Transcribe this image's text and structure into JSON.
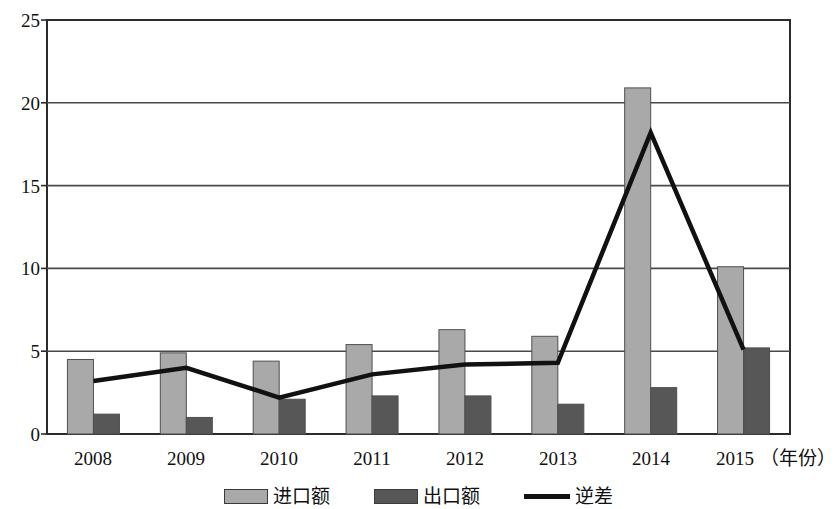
{
  "chart_data": {
    "type": "bar",
    "title": "",
    "subtitle": "",
    "xlabel": "（年份）",
    "ylabel": "",
    "categories": [
      "2008",
      "2009",
      "2010",
      "2011",
      "2012",
      "2013",
      "2014",
      "2015"
    ],
    "ylim": [
      0,
      25
    ],
    "yticks": [
      0,
      5,
      10,
      15,
      20,
      25
    ],
    "grid": true,
    "legend_position": "bottom",
    "series": [
      {
        "name": "进口额",
        "type": "bar",
        "color": "#a9a9a9",
        "values": [
          4.5,
          4.9,
          4.4,
          5.4,
          6.3,
          5.9,
          20.9,
          10.1
        ]
      },
      {
        "name": "出口额",
        "type": "bar",
        "color": "#575757",
        "values": [
          1.2,
          1.0,
          2.1,
          2.3,
          2.3,
          1.8,
          2.8,
          5.2
        ]
      },
      {
        "name": "逆差",
        "type": "line",
        "color": "#111111",
        "values": [
          3.2,
          4.0,
          2.2,
          3.6,
          4.2,
          4.3,
          18.2,
          5.1
        ]
      }
    ]
  },
  "axis": {
    "y_tick_labels": [
      "25",
      "20",
      "15",
      "10",
      "5",
      "0"
    ],
    "x_tick_labels": [
      "2008",
      "2009",
      "2010",
      "2011",
      "2012",
      "2013",
      "2014",
      "2015"
    ],
    "x_axis_unit": "（年份）"
  },
  "legend": {
    "items": [
      {
        "label": "进口额",
        "marker": "bar-swatch-light",
        "color": "#a9a9a9"
      },
      {
        "label": "出口额",
        "marker": "bar-swatch-dark",
        "color": "#575757"
      },
      {
        "label": "逆差",
        "marker": "line-swatch-black",
        "color": "#111111"
      }
    ]
  },
  "plot_geometry": {
    "left": 47,
    "right": 790,
    "top": 20,
    "bottom": 434
  }
}
